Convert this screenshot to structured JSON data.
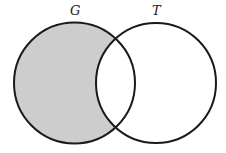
{
  "diagram": {
    "type": "venn",
    "sets": [
      {
        "id": "G",
        "label": "G",
        "cx": 74.5,
        "cy": 83,
        "r": 60.5
      },
      {
        "id": "T",
        "label": "T",
        "cx": 156,
        "cy": 83,
        "r": 60
      }
    ],
    "shaded_region": "G minus T",
    "colors": {
      "shade": "#c8c8c8",
      "stroke": "#1a1a1a",
      "background": "#ffffff"
    }
  }
}
